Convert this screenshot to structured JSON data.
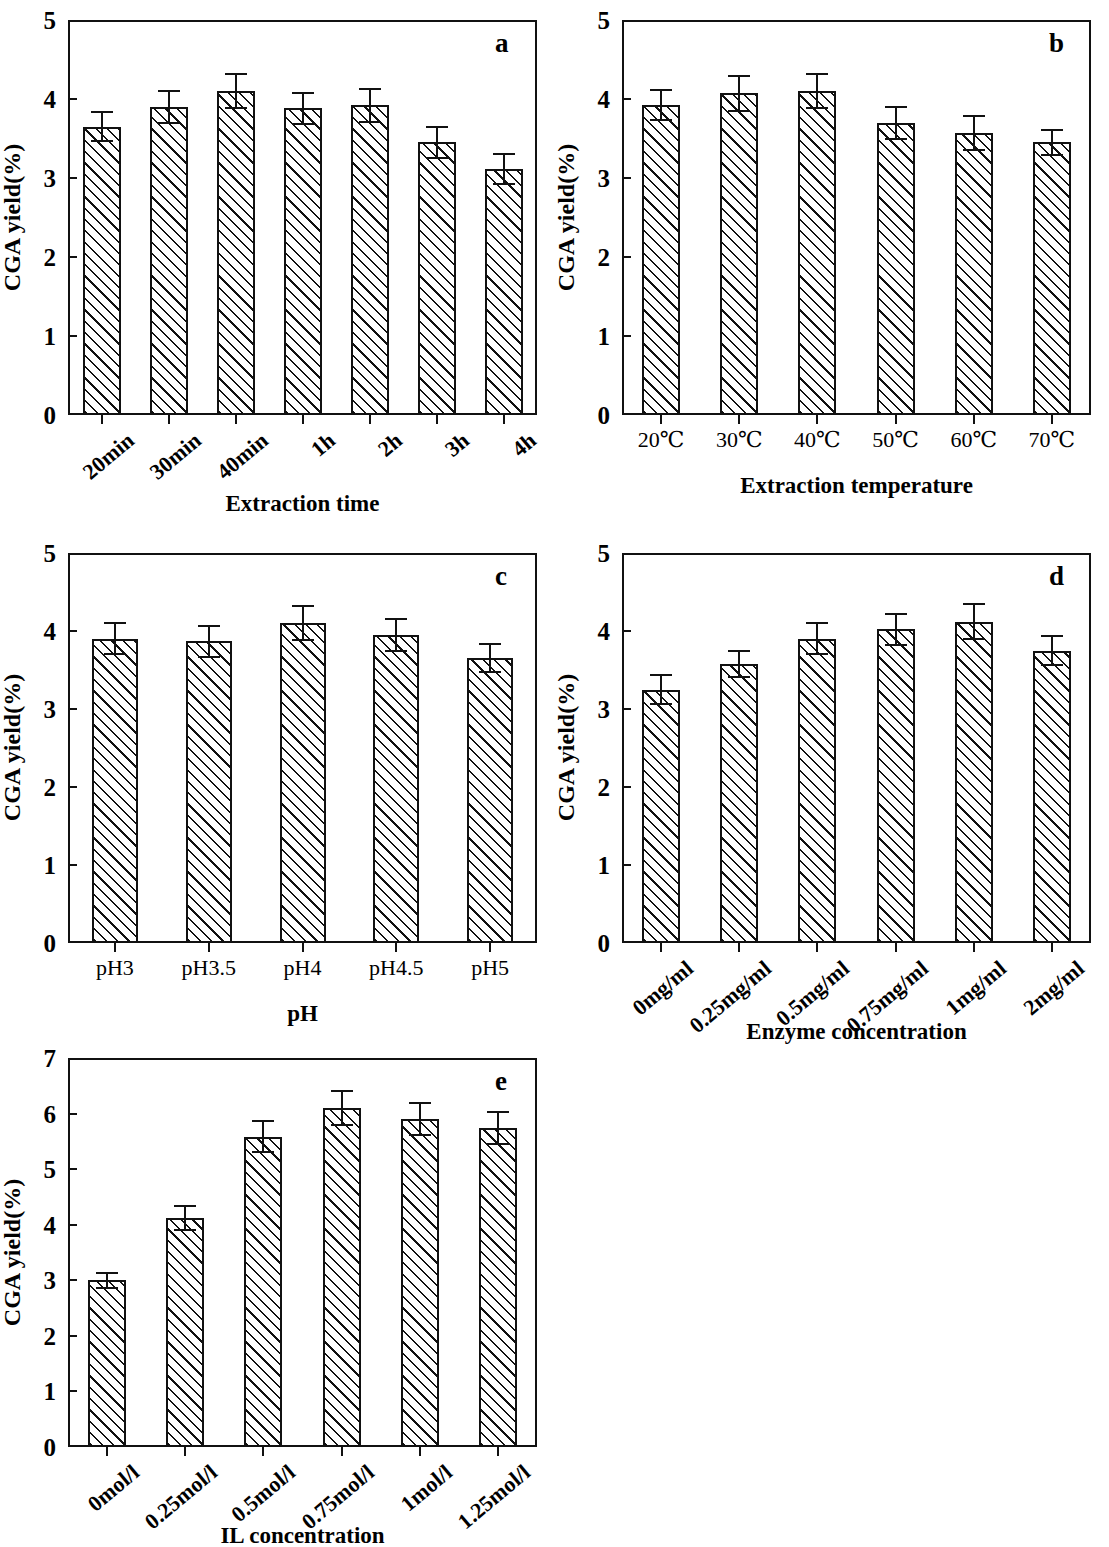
{
  "figure": {
    "panel_count": 5,
    "shared_ylabel": "CGA yield(%)"
  },
  "chart_data": [
    {
      "type": "bar",
      "panel": "a",
      "title": "",
      "xlabel": "Extraction time",
      "ylabel": "CGA yield(%)",
      "ylim": [
        0,
        5
      ],
      "yticks": [
        "0",
        "1",
        "2",
        "3",
        "4",
        "5"
      ],
      "grid": false,
      "legend": "none",
      "categories": [
        "20min",
        "30min",
        "40min",
        "1h",
        "2h",
        "3h",
        "4h"
      ],
      "values": [
        3.65,
        3.9,
        4.1,
        3.88,
        3.92,
        3.45,
        3.12
      ],
      "errors": [
        0.18,
        0.2,
        0.22,
        0.2,
        0.21,
        0.2,
        0.19
      ]
    },
    {
      "type": "bar",
      "panel": "b",
      "title": "",
      "xlabel": "Extraction temperature",
      "ylabel": "CGA yield(%)",
      "ylim": [
        0,
        5
      ],
      "yticks": [
        "0",
        "1",
        "2",
        "3",
        "4",
        "5"
      ],
      "grid": false,
      "legend": "none",
      "categories": [
        "20℃",
        "30℃",
        "40℃",
        "50℃",
        "60℃",
        "70℃"
      ],
      "values": [
        3.93,
        4.07,
        4.1,
        3.7,
        3.57,
        3.45
      ],
      "errors": [
        0.19,
        0.22,
        0.22,
        0.2,
        0.22,
        0.16
      ]
    },
    {
      "type": "bar",
      "panel": "c",
      "title": "",
      "xlabel": "pH",
      "ylabel": "CGA yield(%)",
      "ylim": [
        0,
        5
      ],
      "yticks": [
        "0",
        "1",
        "2",
        "3",
        "4",
        "5"
      ],
      "grid": false,
      "legend": "none",
      "categories": [
        "pH3",
        "pH3.5",
        "pH4",
        "pH4.5",
        "pH5"
      ],
      "values": [
        3.9,
        3.87,
        4.1,
        3.95,
        3.65
      ],
      "errors": [
        0.2,
        0.2,
        0.22,
        0.2,
        0.18
      ]
    },
    {
      "type": "bar",
      "panel": "d",
      "title": "",
      "xlabel": "Enzyme concentration",
      "ylabel": "CGA yield(%)",
      "ylim": [
        0,
        5
      ],
      "yticks": [
        "0",
        "1",
        "2",
        "3",
        "4",
        "5"
      ],
      "grid": false,
      "legend": "none",
      "categories": [
        "0mg/ml",
        "0.25mg/ml",
        "0.5mg/ml",
        "0.75mg/ml",
        "1mg/ml",
        "2mg/ml"
      ],
      "values": [
        3.25,
        3.58,
        3.9,
        4.02,
        4.12,
        3.75
      ],
      "errors": [
        0.18,
        0.17,
        0.2,
        0.2,
        0.22,
        0.18
      ]
    },
    {
      "type": "bar",
      "panel": "e",
      "title": "",
      "xlabel": "IL concentration",
      "ylabel": "CGA yield(%)",
      "ylim": [
        0,
        7
      ],
      "yticks": [
        "0",
        "1",
        "2",
        "3",
        "4",
        "5",
        "6",
        "7"
      ],
      "grid": false,
      "legend": "none",
      "categories": [
        "0mol/l",
        "0.25mol/l",
        "0.5mol/l",
        "0.75mol/l",
        "1mol/l",
        "1.25mol/l"
      ],
      "values": [
        3.0,
        4.12,
        5.58,
        6.1,
        5.9,
        5.74
      ],
      "errors": [
        0.13,
        0.22,
        0.28,
        0.31,
        0.29,
        0.29
      ]
    }
  ],
  "panels": [
    {
      "letter": "a",
      "slanted_xticks": true
    },
    {
      "letter": "b",
      "slanted_xticks": false
    },
    {
      "letter": "c",
      "slanted_xticks": false
    },
    {
      "letter": "d",
      "slanted_xticks": true
    },
    {
      "letter": "e",
      "slanted_xticks": true
    }
  ]
}
